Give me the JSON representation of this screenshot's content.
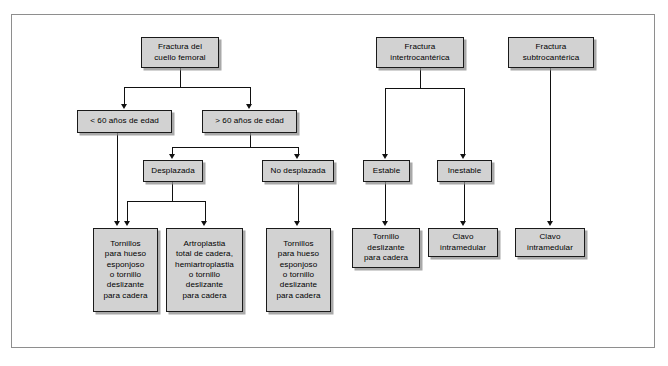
{
  "figure": {
    "kind": "decision-tree-flowchart",
    "language": "es",
    "background_color": "#ffffff",
    "frame_color": "#8e8e8e",
    "node_fill_color": "#d2d2d2",
    "node_border_color": "#1a1a1a",
    "connector_color": "#111111"
  },
  "nodes": {
    "femoral_neck_fracture": "Fractura del\ncuello femoral",
    "age_under_60": "< 60 años de edad",
    "age_over_60": "> 60 años de edad",
    "displaced": "Desplazada",
    "non_displaced": "No desplazada",
    "intertrochanteric_fracture": "Fractura\nintertrocantérica",
    "subtrochanteric_fracture": "Fractura\nsubtrocantérica",
    "stable": "Estable",
    "unstable": "Inestable",
    "treatment_cancellous_screws_1": "Tornillos\npara hueso\nesponjoso\no tornillo\ndeslizante\npara cadera",
    "treatment_arthroplasty": "Artroplastia\ntotal de cadera,\nhemiartroplastia\no tornillo\ndeslizante\npara cadera",
    "treatment_cancellous_screws_2": "Tornillos\npara hueso\nesponjoso\no tornillo\ndeslizante\npara cadera",
    "treatment_sliding_hip_screw": "Tornillo\ndeslizante\npara cadera",
    "treatment_intramedullary_nail_1": "Clavo\nintramedular",
    "treatment_intramedullary_nail_2": "Clavo\nintramedular"
  },
  "edges": [
    {
      "from": "femoral_neck_fracture",
      "to": "age_under_60"
    },
    {
      "from": "femoral_neck_fracture",
      "to": "age_over_60"
    },
    {
      "from": "age_over_60",
      "to": "displaced"
    },
    {
      "from": "age_over_60",
      "to": "non_displaced"
    },
    {
      "from": "age_under_60",
      "to": "treatment_cancellous_screws_1"
    },
    {
      "from": "displaced",
      "to": "treatment_cancellous_screws_1"
    },
    {
      "from": "displaced",
      "to": "treatment_arthroplasty"
    },
    {
      "from": "non_displaced",
      "to": "treatment_cancellous_screws_2"
    },
    {
      "from": "intertrochanteric_fracture",
      "to": "stable"
    },
    {
      "from": "intertrochanteric_fracture",
      "to": "unstable"
    },
    {
      "from": "stable",
      "to": "treatment_sliding_hip_screw"
    },
    {
      "from": "unstable",
      "to": "treatment_intramedullary_nail_1"
    },
    {
      "from": "subtrochanteric_fracture",
      "to": "treatment_intramedullary_nail_2"
    }
  ]
}
